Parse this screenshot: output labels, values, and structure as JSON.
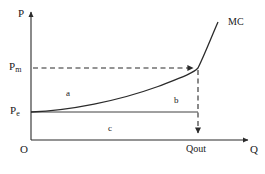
{
  "figure": {
    "background_color": "#ffffff",
    "line_color": "#2b2b2b",
    "caption_color": "#cfcfcf",
    "caption_text": " "
  },
  "axes": {
    "y_axis_label": "P",
    "x_axis_label": "Q",
    "origin_label": "O",
    "x_range_px": [
      31,
      250
    ],
    "y_range_px": [
      140,
      10
    ]
  },
  "ticks": {
    "y": [
      {
        "label_main": "P",
        "label_sub": "m",
        "value_name": "Pm",
        "y_px": 68
      },
      {
        "label_main": "P",
        "label_sub": "e",
        "value_name": "Pe",
        "y_px": 112
      }
    ],
    "x": [
      {
        "label": "Qout",
        "x_px": 198
      }
    ]
  },
  "curves": [
    {
      "name": "MC",
      "label": "MC",
      "label_x_px": 232,
      "label_y_px": 22,
      "style": "solid",
      "path": "M31,112 C70,110 120,100 160,85 C185,75 195,72 198,68 C205,56 212,38 218,22"
    }
  ],
  "lines": [
    {
      "name": "pe-horizontal-line",
      "style": "solid",
      "from_px": [
        31,
        112
      ],
      "to_px": [
        198,
        112
      ]
    },
    {
      "name": "pm-horizontal-dashed",
      "style": "dashed",
      "from_px": [
        31,
        68
      ],
      "to_px": [
        196,
        68
      ],
      "arrow_at_end": true
    },
    {
      "name": "qout-vertical-dashed",
      "style": "dashed",
      "from_px": [
        198,
        68
      ],
      "to_px": [
        198,
        138
      ],
      "arrow_at_end": true
    }
  ],
  "regions": [
    {
      "label": "a",
      "x_px": 68,
      "y_px": 93
    },
    {
      "label": "b",
      "x_px": 176,
      "y_px": 100
    },
    {
      "label": "c",
      "x_px": 110,
      "y_px": 128
    }
  ]
}
